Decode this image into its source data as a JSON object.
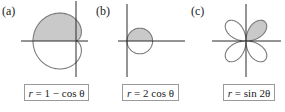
{
  "colors": {
    "axis": "#2a2a2a",
    "curve": "#7a7a7a",
    "shade": "#c9c9c9",
    "box_border": "#9a9a9a"
  },
  "panels": [
    {
      "id": "a",
      "label": "(a)",
      "equation": {
        "lhs": "r",
        "rhs": "1 − cos θ"
      },
      "curve": "cardioid",
      "shaded_region": "upper half (0 ≤ θ ≤ π)"
    },
    {
      "id": "b",
      "label": "(b)",
      "equation": {
        "lhs": "r",
        "rhs": "2 cos θ"
      },
      "curve": "circle",
      "shaded_region": "upper half (0 ≤ θ ≤ π/2)"
    },
    {
      "id": "c",
      "label": "(c)",
      "equation": {
        "lhs": "r",
        "rhs": "sin 2θ"
      },
      "curve": "four-leaved rose",
      "shaded_region": "first-quadrant petal (0 ≤ θ ≤ π/2)"
    }
  ],
  "chart_data": [
    {
      "type": "polar",
      "title": "(a)",
      "equation": "r = 1 − cos θ",
      "shaded": {
        "theta_start_deg": 0,
        "theta_end_deg": 180
      },
      "samples_deg": [
        0,
        60,
        90,
        120,
        180,
        240,
        270,
        300,
        360
      ],
      "r_values": [
        0,
        0.5,
        1,
        1.5,
        2,
        1.5,
        1,
        0.5,
        0
      ],
      "axes": true
    },
    {
      "type": "polar",
      "title": "(b)",
      "equation": "r = 2 cos θ",
      "shaded": {
        "theta_start_deg": 0,
        "theta_end_deg": 90
      },
      "samples_deg": [
        -90,
        -60,
        0,
        60,
        90
      ],
      "r_values": [
        0,
        1,
        2,
        1,
        0
      ],
      "axes": true
    },
    {
      "type": "polar",
      "title": "(c)",
      "equation": "r = sin 2θ",
      "shaded": {
        "theta_start_deg": 0,
        "theta_end_deg": 90
      },
      "samples_deg": [
        0,
        45,
        90,
        135,
        180,
        225,
        270,
        315,
        360
      ],
      "r_values": [
        0,
        1,
        0,
        -1,
        0,
        1,
        0,
        -1,
        0
      ],
      "axes": true
    }
  ]
}
